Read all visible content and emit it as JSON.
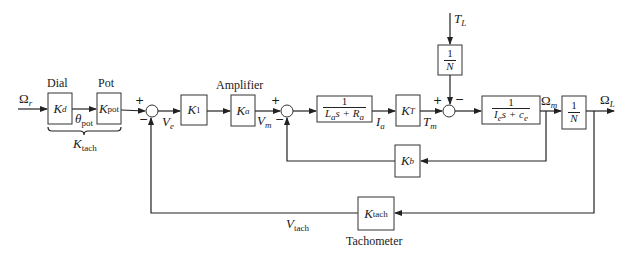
{
  "diagram": {
    "type": "block-diagram",
    "title": "",
    "blocks": {
      "dial": {
        "caption": "Dial",
        "gain_main": "K",
        "gain_sub": "d"
      },
      "pot": {
        "caption": "Pot",
        "gain_main": "K",
        "gain_sub": "pot"
      },
      "k1": {
        "gain_main": "K",
        "gain_sub": "1"
      },
      "amplifier": {
        "caption": "Amplifier",
        "gain_main": "K",
        "gain_sub": "a"
      },
      "armature": {
        "numerator": "1",
        "den_parts": [
          "L",
          "a",
          "s + R",
          "a"
        ]
      },
      "torque_const": {
        "gain_main": "K",
        "gain_sub": "T"
      },
      "load_gear": {
        "numerator": "1",
        "denominator": "N"
      },
      "mechanical": {
        "numerator": "1",
        "den_parts": [
          "I",
          "e",
          "s + c",
          "e"
        ]
      },
      "output_gear": {
        "numerator": "1",
        "denominator": "N"
      },
      "back_emf": {
        "gain_main": "K",
        "gain_sub": "b"
      },
      "tachometer": {
        "caption": "Tachometer",
        "gain_main": "K",
        "gain_sub": "tach"
      }
    },
    "signals": {
      "input": {
        "main": "Ω",
        "sub": "r"
      },
      "theta_pot": {
        "main": "θ",
        "sub": "pot"
      },
      "brace_label": {
        "main": "K",
        "sub": "tach"
      },
      "ve": {
        "main": "V",
        "sub": "e"
      },
      "vm": {
        "main": "V",
        "sub": "m"
      },
      "ia": {
        "main": "I",
        "sub": "a"
      },
      "tm": {
        "main": "T",
        "sub": "m"
      },
      "tl": {
        "main": "T",
        "sub": "L"
      },
      "omega_m": {
        "main": "Ω",
        "sub": "m"
      },
      "omega_l": {
        "main": "Ω",
        "sub": "L"
      },
      "vtach": {
        "main": "V",
        "sub": "tach"
      }
    },
    "signs": {
      "sum1_plus": "+",
      "sum1_minus": "−",
      "sum2_plus": "+",
      "sum2_minus": "−",
      "sum3_plus": "+",
      "sum3_minus": "−"
    },
    "colors": {
      "line": "#222222",
      "background": "#ffffff"
    }
  }
}
